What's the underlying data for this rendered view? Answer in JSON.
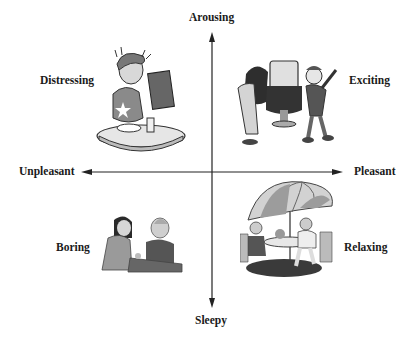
{
  "axes": {
    "top": "Arousing",
    "bottom": "Sleepy",
    "left": "Unpleasant",
    "right": "Pleasant"
  },
  "quadrants": [
    {
      "position": "top-left",
      "label": "Distressing",
      "illustration": "man-at-restaurant-table-reading-menu-shocked"
    },
    {
      "position": "top-right",
      "label": "Exciting",
      "illustration": "two-men-at-arcade-machine"
    },
    {
      "position": "bottom-left",
      "label": "Boring",
      "illustration": "two-women-talking-at-counter"
    },
    {
      "position": "bottom-right",
      "label": "Relaxing",
      "illustration": "people-at-patio-table-under-umbrella"
    }
  ],
  "colors": {
    "axis": "#1a1a1a",
    "text": "#1a1a1a",
    "background": "#ffffff"
  }
}
